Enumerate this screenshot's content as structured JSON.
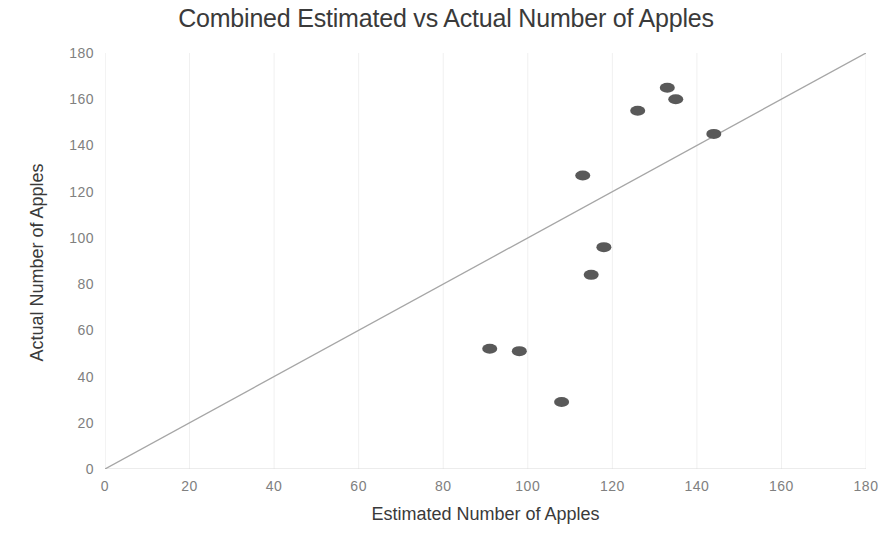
{
  "chart_data": {
    "type": "scatter",
    "title": "Combined Estimated vs Actual Number of Apples",
    "xlabel": "Estimated Number of Apples",
    "ylabel": "Actual Number of Apples",
    "xlim": [
      0,
      180
    ],
    "ylim": [
      0,
      180
    ],
    "xticks": [
      0,
      20,
      40,
      60,
      80,
      100,
      120,
      140,
      160,
      180
    ],
    "yticks": [
      0,
      20,
      40,
      60,
      80,
      100,
      120,
      140,
      160,
      180
    ],
    "grid": "faint-vertical",
    "legend": null,
    "marker_color": "#595959",
    "marker_shape": "ellipse",
    "reference_line": {
      "name": "y = x identity line",
      "from": [
        0,
        0
      ],
      "to": [
        180,
        180
      ],
      "color": "#a6a6a6"
    },
    "points": [
      {
        "x": 91,
        "y": 52
      },
      {
        "x": 98,
        "y": 51
      },
      {
        "x": 108,
        "y": 29
      },
      {
        "x": 113,
        "y": 127
      },
      {
        "x": 115,
        "y": 84
      },
      {
        "x": 118,
        "y": 96
      },
      {
        "x": 126,
        "y": 155
      },
      {
        "x": 133,
        "y": 165
      },
      {
        "x": 135,
        "y": 160
      },
      {
        "x": 144,
        "y": 145
      }
    ]
  },
  "colors": {
    "marker": "#595959",
    "reference_line": "#a6a6a6",
    "gridline": "#f0f0f0",
    "axis_text": "#808080",
    "title_text": "#3a3a3a",
    "background": "#ffffff"
  }
}
